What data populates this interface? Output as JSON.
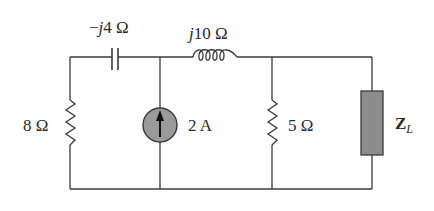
{
  "diagram": {
    "type": "circuit-schematic",
    "colors": {
      "wire": "#3a3a3a",
      "source_fill": "#9a9a9a",
      "load_fill": "#8c8c8c",
      "text": "#2a2a2a",
      "background": "#ffffff"
    },
    "components": [
      {
        "id": "capacitor",
        "kind": "capacitor",
        "label_j": "j",
        "label_prefix": "−",
        "label_value": "4 Ω"
      },
      {
        "id": "inductor",
        "kind": "inductor",
        "label_j": "j",
        "label_value": "10 Ω"
      },
      {
        "id": "r8",
        "kind": "resistor",
        "label": "8 Ω"
      },
      {
        "id": "isrc",
        "kind": "current-source",
        "label": "2 A",
        "direction": "up"
      },
      {
        "id": "r5",
        "kind": "resistor",
        "label": "5 Ω"
      },
      {
        "id": "zl",
        "kind": "load-impedance",
        "label_main": "Z",
        "label_sub": "L"
      }
    ]
  }
}
